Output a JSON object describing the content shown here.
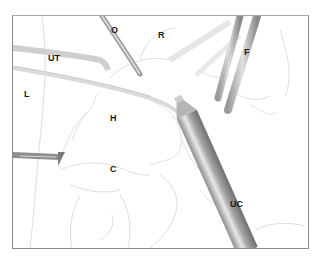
{
  "figure": {
    "type": "surgical-illustration",
    "labels": {
      "O": "O",
      "R": "R",
      "UT": "UT",
      "F": "F",
      "L": "L",
      "H": "H",
      "C": "C",
      "UC": "UC"
    }
  }
}
